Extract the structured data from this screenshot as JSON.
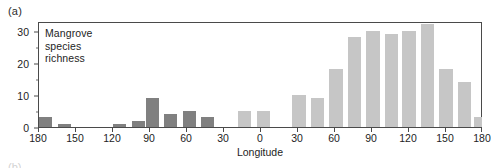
{
  "figure": {
    "panel_label": "(a)",
    "next_panel_label": "(b)",
    "annotation": "Mangrove\nspecies\nrichness"
  },
  "chart_data": {
    "type": "bar",
    "title": "Mangrove species richness",
    "xlabel": "Longitude",
    "ylabel": "",
    "ylim": [
      0,
      33
    ],
    "xlim": [
      -180,
      180
    ],
    "grid": false,
    "legend": "none",
    "bin_width_degrees": 15,
    "y_ticks": [
      0,
      10,
      20,
      30
    ],
    "y_tick_labels": [
      "0",
      "10",
      "20",
      "30"
    ],
    "x_ticks": [
      -180,
      -150,
      -120,
      -90,
      -60,
      -30,
      0,
      30,
      60,
      90,
      120,
      150,
      180
    ],
    "x_tick_labels": [
      "180",
      "150",
      "120",
      "90",
      "60",
      "30",
      "0",
      "30",
      "60",
      "90",
      "120",
      "150",
      "180"
    ],
    "colors": {
      "dark_bar": "#808080",
      "light_bar": "#c6c6c6",
      "axis": "#4a4a4a",
      "text": "#1d1d1d",
      "background": "#ffffff"
    },
    "bars": [
      {
        "bin_center": -172.5,
        "value": 3,
        "color": "dark"
      },
      {
        "bin_center": -157.5,
        "value": 1,
        "color": "dark"
      },
      {
        "bin_center": -142.5,
        "value": 0,
        "color": "dark"
      },
      {
        "bin_center": -127.5,
        "value": 0,
        "color": "dark"
      },
      {
        "bin_center": -112.5,
        "value": 1,
        "color": "dark"
      },
      {
        "bin_center": -97.5,
        "value": 2,
        "color": "dark"
      },
      {
        "bin_center": -86.0,
        "value": 9,
        "color": "dark"
      },
      {
        "bin_center": -71.0,
        "value": 4,
        "color": "dark"
      },
      {
        "bin_center": -56.0,
        "value": 5,
        "color": "dark"
      },
      {
        "bin_center": -41.0,
        "value": 3,
        "color": "dark"
      },
      {
        "bin_center": -26.0,
        "value": 0,
        "color": "dark"
      },
      {
        "bin_center": -11.0,
        "value": 5,
        "color": "light"
      },
      {
        "bin_center": 4.0,
        "value": 5,
        "color": "light"
      },
      {
        "bin_center": 19.0,
        "value": 0,
        "color": "light"
      },
      {
        "bin_center": 33.0,
        "value": 10,
        "color": "light"
      },
      {
        "bin_center": 48.0,
        "value": 9,
        "color": "light"
      },
      {
        "bin_center": 63.0,
        "value": 18,
        "color": "light"
      },
      {
        "bin_center": 78.0,
        "value": 28,
        "color": "light"
      },
      {
        "bin_center": 93.0,
        "value": 30,
        "color": "light"
      },
      {
        "bin_center": 108.0,
        "value": 29,
        "color": "light"
      },
      {
        "bin_center": 122.0,
        "value": 30,
        "color": "light"
      },
      {
        "bin_center": 137.0,
        "value": 32,
        "color": "light"
      },
      {
        "bin_center": 152.0,
        "value": 18,
        "color": "light"
      },
      {
        "bin_center": 167.0,
        "value": 14,
        "color": "light"
      },
      {
        "bin_center": 180.0,
        "value": 3,
        "color": "light"
      }
    ]
  }
}
